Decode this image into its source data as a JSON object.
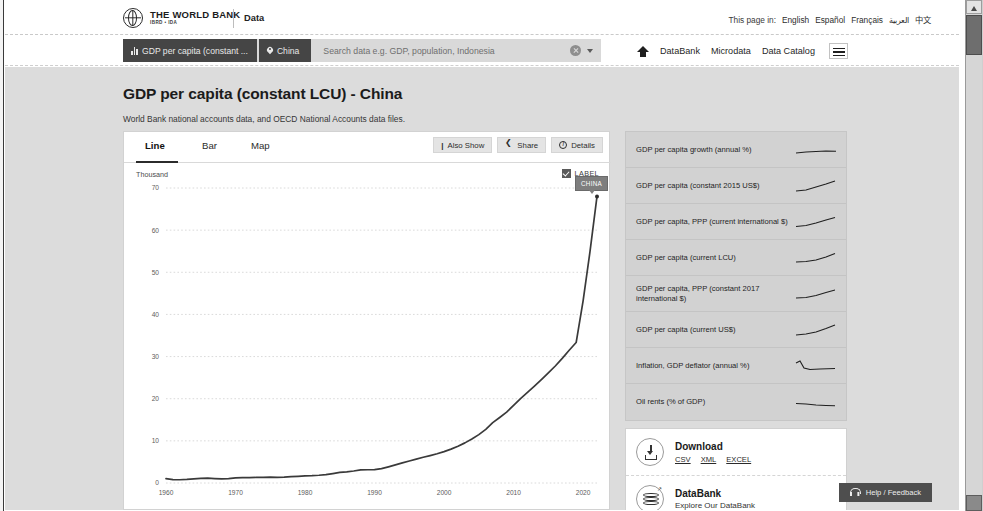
{
  "window": {
    "scrollbar": {
      "up_arrow": "▲",
      "down_arrow": "▼"
    }
  },
  "header": {
    "brand_line1": "THE WORLD BANK",
    "brand_line2": "IBRD • IDA",
    "brand_section": "Data",
    "language_label": "This page in:",
    "languages": [
      "English",
      "Español",
      "Français",
      "العربية",
      "中文"
    ]
  },
  "search": {
    "indicator_chip": "GDP per capita (constant ...",
    "geography_chip": "China",
    "placeholder": "Search data e.g. GDP, population, Indonesia",
    "clear_icon": "clear-icon",
    "caret_icon": "chevron-down-icon"
  },
  "nav": {
    "home_icon": "home-icon",
    "items": [
      "DataBank",
      "Microdata",
      "Data Catalog"
    ],
    "menu_icon": "hamburger-menu-icon"
  },
  "page": {
    "title": "GDP per capita (constant LCU) - China",
    "source": "World Bank national accounts data, and OECD National Accounts data files."
  },
  "chart_card": {
    "tabs": [
      {
        "label": "Line",
        "active": true
      },
      {
        "label": "Bar",
        "active": false
      },
      {
        "label": "Map",
        "active": false
      }
    ],
    "buttons": [
      {
        "label": "Also Show",
        "icon": "also-show-icon"
      },
      {
        "label": "Share",
        "icon": "share-icon"
      },
      {
        "label": "Details",
        "icon": "info-icon"
      }
    ],
    "unit_label": "Thousand",
    "label_toggle": {
      "label": "LABEL",
      "checked": true
    },
    "series_tooltip": "CHINA"
  },
  "chart_data": {
    "type": "line",
    "title": "GDP per capita (constant LCU) - China",
    "subtitle": "World Bank national accounts data, and OECD National Accounts data files.",
    "xlabel": "",
    "ylabel": "Thousand",
    "xlim": [
      1960,
      2022
    ],
    "ylim": [
      0,
      70
    ],
    "xticks": [
      1960,
      1970,
      1980,
      1990,
      2000,
      2010,
      2020
    ],
    "yticks": [
      0,
      10,
      20,
      30,
      40,
      50,
      60,
      70
    ],
    "grid": true,
    "legend": "none",
    "annotations": [
      {
        "text": "CHINA",
        "x": 2022,
        "y": 68.5
      }
    ],
    "series": [
      {
        "name": "CHINA",
        "color": "#3a3a3a",
        "x": [
          1960,
          1961,
          1962,
          1963,
          1964,
          1965,
          1966,
          1967,
          1968,
          1969,
          1970,
          1971,
          1972,
          1973,
          1974,
          1975,
          1976,
          1977,
          1978,
          1979,
          1980,
          1981,
          1982,
          1983,
          1984,
          1985,
          1986,
          1987,
          1988,
          1989,
          1990,
          1991,
          1992,
          1993,
          1994,
          1995,
          1996,
          1997,
          1998,
          1999,
          2000,
          2001,
          2002,
          2003,
          2004,
          2005,
          2006,
          2007,
          2008,
          2009,
          2010,
          2011,
          2012,
          2013,
          2014,
          2015,
          2016,
          2017,
          2018,
          2019,
          2020,
          2021,
          2022
        ],
        "y": [
          1.05,
          0.81,
          0.77,
          0.84,
          0.96,
          1.08,
          1.14,
          1.05,
          0.97,
          1.05,
          1.22,
          1.28,
          1.27,
          1.33,
          1.32,
          1.4,
          1.32,
          1.38,
          1.51,
          1.58,
          1.67,
          1.73,
          1.84,
          1.99,
          2.24,
          2.51,
          2.64,
          2.85,
          3.1,
          3.14,
          3.17,
          3.41,
          3.84,
          4.3,
          4.76,
          5.23,
          5.66,
          6.11,
          6.51,
          6.94,
          7.45,
          8.03,
          8.71,
          9.52,
          10.43,
          11.48,
          12.74,
          14.31,
          15.54,
          16.82,
          18.42,
          20.04,
          21.51,
          23.01,
          24.54,
          26.13,
          27.76,
          29.58,
          31.5,
          33.33,
          43.2,
          55.0,
          68.0
        ]
      }
    ]
  },
  "sidebar": {
    "indicators": [
      "GDP per capita growth (annual %)",
      "GDP per capita (constant 2015 US$)",
      "GDP per capita, PPP (current international $)",
      "GDP per capita (current LCU)",
      "GDP per capita, PPP (constant 2017 international $)",
      "GDP per capita (current US$)",
      "Inflation, GDP deflator (annual %)",
      "Oil rents (% of GDP)"
    ],
    "download_card": {
      "icon": "download-icon",
      "title": "Download",
      "links": [
        "CSV",
        "XML",
        "EXCEL"
      ]
    },
    "databank_card": {
      "icon": "database-icon",
      "badge": "↗",
      "title": "DataBank",
      "subtitle": "Explore Our DataBank"
    }
  },
  "help_widget": {
    "icon": "headset-icon",
    "label": "Help / Feedback"
  }
}
